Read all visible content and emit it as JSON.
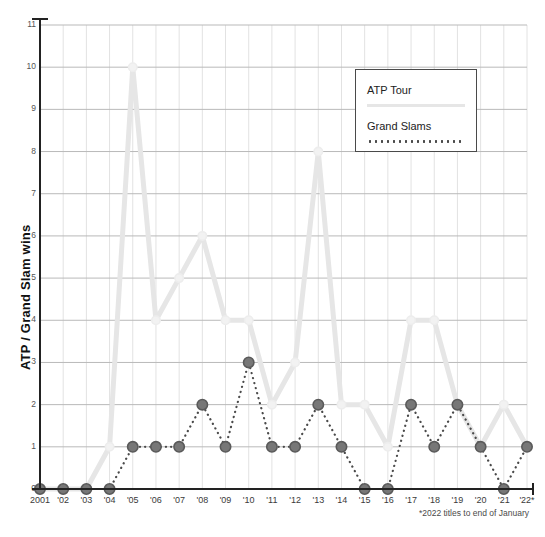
{
  "chart_data": {
    "type": "line",
    "title": "",
    "xlabel": "",
    "ylabel": "ATP / Grand Slam wins",
    "ylim": [
      0,
      11
    ],
    "yticks": [
      0,
      1,
      2,
      3,
      4,
      5,
      6,
      7,
      8,
      9,
      10,
      11
    ],
    "grid": true,
    "legend_position": "top-right",
    "categories": [
      "2001",
      "'02",
      "'03",
      "'04",
      "'05",
      "'06",
      "'07",
      "'08",
      "'09",
      "'10",
      "'11",
      "'12",
      "'13",
      "'14",
      "'15",
      "'16",
      "'17",
      "'18",
      "'19",
      "'20",
      "'21",
      "'22*"
    ],
    "x": [
      2001,
      2002,
      2003,
      2004,
      2005,
      2006,
      2007,
      2008,
      2009,
      2010,
      2011,
      2012,
      2013,
      2014,
      2015,
      2016,
      2017,
      2018,
      2019,
      2020,
      2021,
      2022
    ],
    "series": [
      {
        "name": "ATP Tour",
        "style": "solid",
        "color": "#e6e6e6",
        "marker_color": "#f2f2f2",
        "values": [
          0,
          0,
          0,
          1,
          10,
          4,
          5,
          6,
          4,
          4,
          2,
          3,
          8,
          2,
          2,
          1,
          4,
          4,
          2,
          1,
          2,
          1
        ]
      },
      {
        "name": "Grand Slams",
        "style": "dotted",
        "color": "#4a4a4a",
        "marker_color": "#777777",
        "values": [
          0,
          0,
          0,
          0,
          1,
          1,
          1,
          2,
          1,
          3,
          1,
          1,
          2,
          1,
          0,
          0,
          2,
          1,
          2,
          1,
          0,
          1
        ]
      }
    ],
    "annotations": [
      "*2022 titles to end of January"
    ]
  },
  "legend": {
    "items": [
      {
        "label": "ATP Tour"
      },
      {
        "label": "Grand Slams"
      }
    ]
  },
  "footnote": "*2022 titles to end of January",
  "colors": {
    "atp_line": "#e6e6e6",
    "slam_line": "#4a4a4a",
    "grid": "#bdbdbd",
    "axis": "#222222",
    "text": "#333333"
  }
}
